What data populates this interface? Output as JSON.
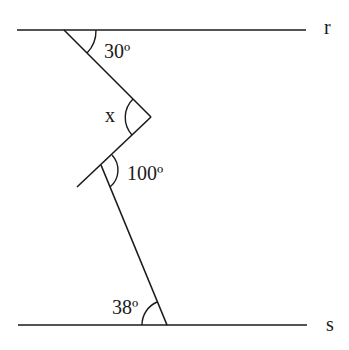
{
  "diagram": {
    "type": "geometry-parallel-lines",
    "lines": [
      {
        "name": "r",
        "label": "r"
      },
      {
        "name": "s",
        "label": "s"
      }
    ],
    "angles": [
      {
        "id": "top-angle",
        "label": "30º"
      },
      {
        "id": "x-angle",
        "label": "x"
      },
      {
        "id": "middle-angle",
        "label": "100º"
      },
      {
        "id": "bottom-angle",
        "label": "38º"
      }
    ],
    "colors": {
      "stroke": "#1a1a1a",
      "background": "#ffffff"
    }
  }
}
